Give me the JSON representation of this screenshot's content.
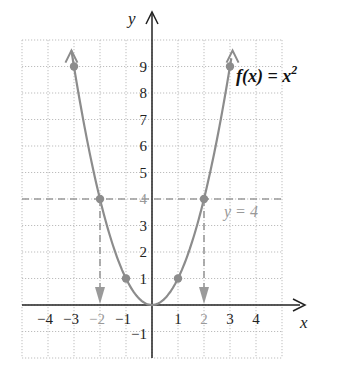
{
  "chart_data": {
    "type": "line",
    "title": "",
    "function_label": "f(x) = x",
    "function_exponent": "2",
    "xlabel": "x",
    "ylabel": "y",
    "xlim": [
      -5,
      5
    ],
    "ylim": [
      -2,
      10
    ],
    "grid": true,
    "x_ticks": [
      "-4",
      "-3",
      "-2",
      "-1",
      "1",
      "2",
      "3",
      "4"
    ],
    "x_tick_values": [
      -4,
      -3,
      -2,
      -1,
      1,
      2,
      3,
      4
    ],
    "x_ticks_highlighted": [
      -2,
      2
    ],
    "y_ticks": [
      "-1",
      "1",
      "2",
      "3",
      "4",
      "5",
      "6",
      "7",
      "8",
      "9"
    ],
    "y_tick_values": [
      -1,
      1,
      2,
      3,
      4,
      5,
      6,
      7,
      8,
      9
    ],
    "y_ticks_highlighted": [
      4
    ],
    "series": [
      {
        "name": "f(x) = x^2",
        "x": [
          -3,
          -2,
          -1,
          0,
          1,
          2,
          3
        ],
        "y": [
          9,
          4,
          1,
          0,
          1,
          4,
          9
        ],
        "marked_points": [
          [
            -3,
            9
          ],
          [
            -2,
            4
          ],
          [
            -1,
            1
          ],
          [
            1,
            1
          ],
          [
            2,
            4
          ],
          [
            3,
            9
          ]
        ]
      }
    ],
    "annotations": [
      {
        "type": "horizontal-dashed-line",
        "y": 4,
        "label": "y = 4"
      },
      {
        "type": "vertical-dashed-arrow",
        "x": -2,
        "from_y": 4,
        "to_y": 0
      },
      {
        "type": "vertical-dashed-arrow",
        "x": 2,
        "from_y": 4,
        "to_y": 0
      }
    ],
    "colors": {
      "curve": "#8c8c8c",
      "axis": "#222222",
      "grid": "#bdbdbd",
      "highlight": "#9a9a9a"
    }
  }
}
